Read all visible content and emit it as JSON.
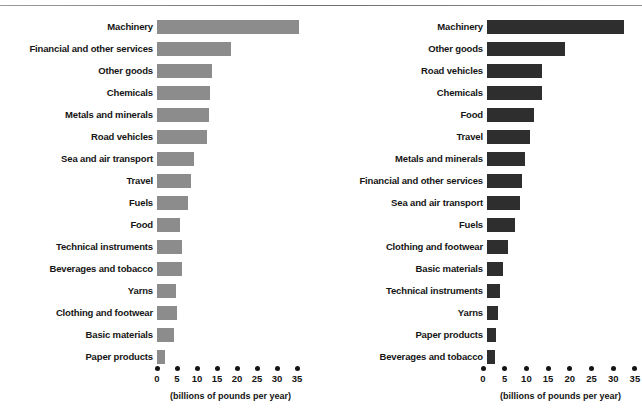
{
  "figure": {
    "axis_caption": "(billions of pounds per year)",
    "bar_color_light": "#8c8c8c",
    "bar_color_dark": "#2e2e2e",
    "tick_labels": [
      "0",
      "5",
      "10",
      "15",
      "20",
      "25",
      "30",
      "35"
    ]
  },
  "chart_data": [
    {
      "type": "bar",
      "title": "",
      "orientation": "horizontal",
      "xlabel": "(billions of pounds per year)",
      "ylabel": "",
      "xlim": [
        0,
        35
      ],
      "xticks": [
        0,
        5,
        10,
        15,
        20,
        25,
        30,
        35
      ],
      "grid": false,
      "legend": "none",
      "color": "#8c8c8c",
      "categories": [
        "Machinery",
        "Financial and other services",
        "Other goods",
        "Chemicals",
        "Metals and minerals",
        "Road vehicles",
        "Sea and air transport",
        "Travel",
        "Fuels",
        "Food",
        "Technical instruments",
        "Beverages and tobacco",
        "Yarns",
        "Clothing and footwear",
        "Basic materials",
        "Paper products"
      ],
      "values": [
        35.5,
        18.5,
        13.8,
        13.2,
        13.0,
        12.5,
        9.2,
        8.5,
        7.8,
        5.8,
        6.2,
        6.2,
        4.8,
        5.0,
        4.2,
        2.0
      ]
    },
    {
      "type": "bar",
      "title": "",
      "orientation": "horizontal",
      "xlabel": "(billions of pounds per year)",
      "ylabel": "",
      "xlim": [
        0,
        35
      ],
      "xticks": [
        0,
        5,
        10,
        15,
        20,
        25,
        30,
        35
      ],
      "grid": false,
      "legend": "none",
      "color": "#2e2e2e",
      "categories": [
        "Machinery",
        "Other goods",
        "Road vehicles",
        "Chemicals",
        "Food",
        "Travel",
        "Metals and minerals",
        "Financial and other services",
        "Sea and air transport",
        "Fuels",
        "Clothing and footwear",
        "Basic materials",
        "Technical instruments",
        "Yarns",
        "Paper products",
        "Beverages and tobacco"
      ],
      "values": [
        31.6,
        18.0,
        12.7,
        12.7,
        10.8,
        9.9,
        8.8,
        8.0,
        7.6,
        6.4,
        4.8,
        3.7,
        3.0,
        2.5,
        2.0,
        1.8
      ]
    }
  ]
}
